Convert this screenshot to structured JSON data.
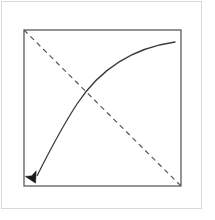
{
  "figure": {
    "background_color": "#ffffff",
    "outer_frame": {
      "name": "outer-frame",
      "stroke_color": "#d9d9d9",
      "stroke_width": 1,
      "x": 1,
      "y": 1,
      "width": 201,
      "height": 208
    },
    "plot_box": {
      "name": "plot-box",
      "stroke_color": "#4d4d4d",
      "stroke_width": 1.2,
      "fill": "none",
      "x": 24,
      "y": 30,
      "width": 157,
      "height": 156
    },
    "dashed_diagonal": {
      "name": "dashed-diagonal-line",
      "stroke_color": "#555555",
      "stroke_width": 1.2,
      "dash_pattern": "5,4",
      "x1": 24,
      "y1": 30,
      "x2": 181,
      "y2": 186
    },
    "curved_arrow": {
      "name": "curved-arrow",
      "stroke_color": "#3b3b3b",
      "stroke_width": 1.3,
      "fill": "none",
      "start_x": 175,
      "start_y": 42,
      "end_x": 36,
      "end_y": 176,
      "arrowhead_tip_x": 35,
      "arrowhead_tip_y": 183,
      "arrowhead_fill": "#1a1a1a"
    },
    "intersection_point": {
      "name": "curve-diagonal-intersection",
      "x": 85,
      "y": 89
    }
  },
  "chart_data": {
    "type": "line",
    "title": "",
    "xlabel": "",
    "ylabel": "",
    "xlim": [
      0,
      1
    ],
    "ylim": [
      0,
      1
    ],
    "grid": false,
    "legend": null,
    "series": [
      {
        "name": "dashed-diagonal",
        "style": "dashed",
        "color": "#555555",
        "points": [
          [
            0,
            1
          ],
          [
            1,
            0
          ]
        ]
      },
      {
        "name": "curved-arrow",
        "style": "solid-with-arrowhead",
        "color": "#3b3b3b",
        "points": [
          [
            0.96,
            0.92
          ],
          [
            0.7,
            0.8
          ],
          [
            0.45,
            0.6
          ],
          [
            0.26,
            0.36
          ],
          [
            0.12,
            0.12
          ],
          [
            0.07,
            0.04
          ]
        ]
      }
    ],
    "annotations": [
      {
        "name": "intersection",
        "x": 0.39,
        "y": 0.62,
        "label": ""
      }
    ]
  }
}
